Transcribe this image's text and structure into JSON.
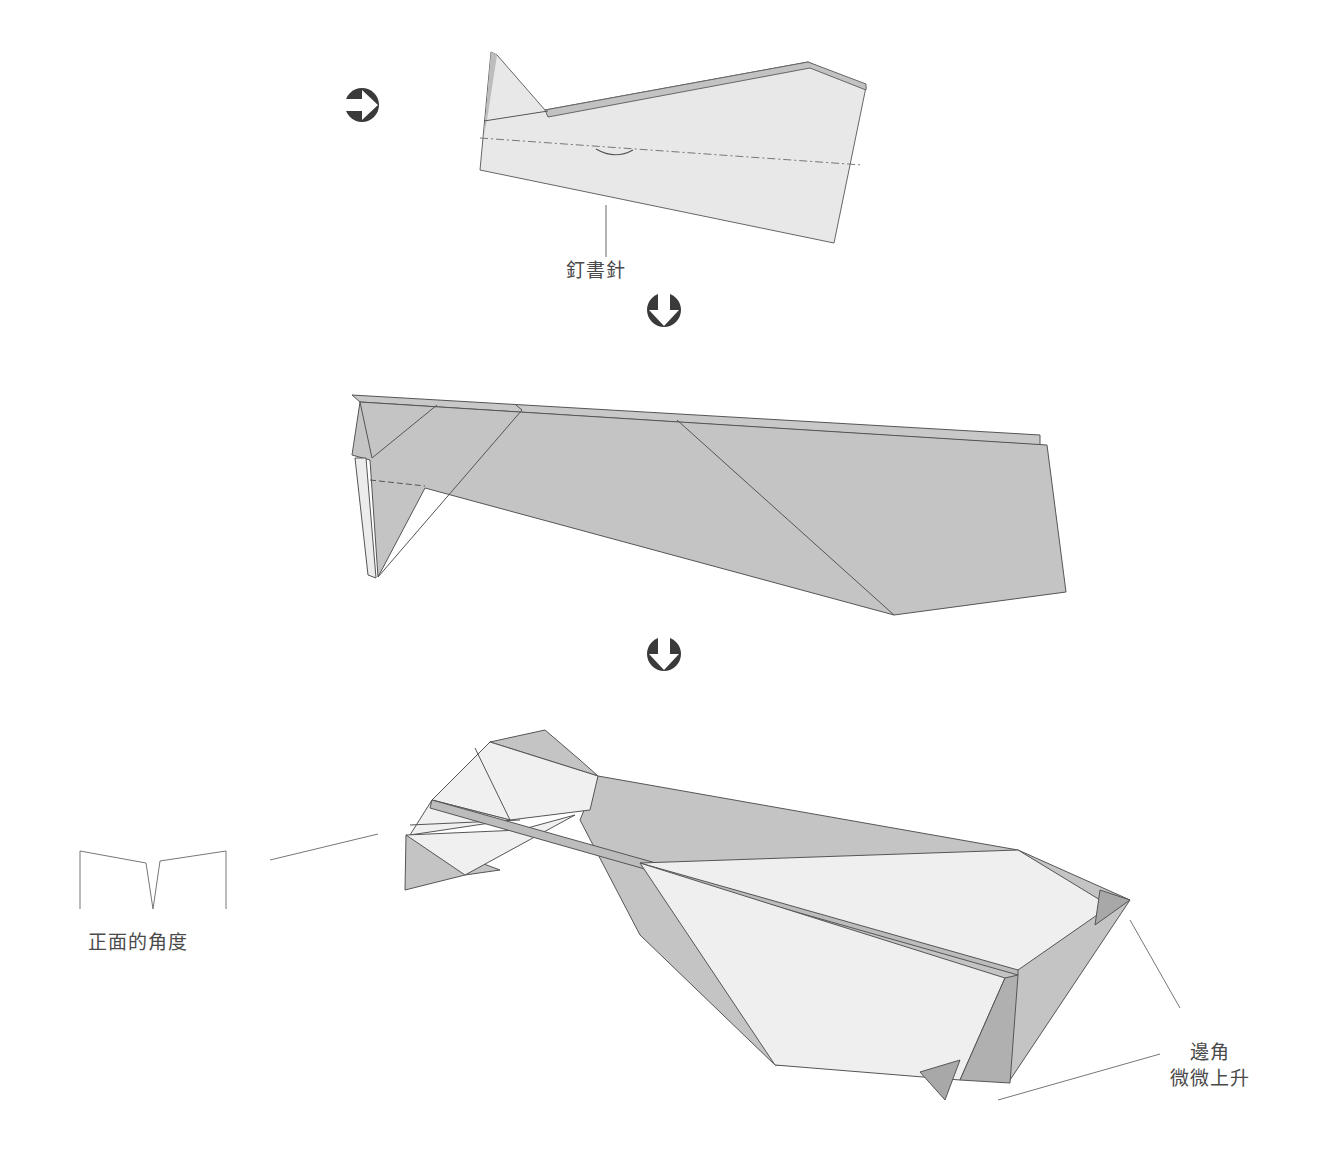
{
  "labels": {
    "staple": "釘書針",
    "front_angle": "正面的角度",
    "edge_line1": "邊角",
    "edge_line2": "微微上升"
  },
  "icons": {
    "step_arrow_right": "circle-arrow-right",
    "step_arrow_down_1": "circle-arrow-down",
    "step_arrow_down_2": "circle-arrow-down"
  },
  "colors": {
    "paper_light": "#e6e6e6",
    "paper_white": "#f0f0f0",
    "paper_shade": "#c4c4c4",
    "edge": "#555555",
    "arrow": "#3a3a3a",
    "text": "#4a4a4a"
  }
}
